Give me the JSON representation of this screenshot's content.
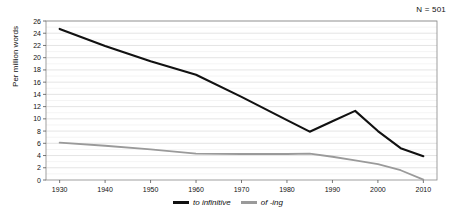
{
  "annotation": {
    "n_label": "N = 501"
  },
  "axes": {
    "ylabel": "Per million words",
    "xlabel": "",
    "yticks": [
      0,
      2,
      4,
      6,
      8,
      10,
      12,
      14,
      16,
      18,
      20,
      22,
      24,
      26
    ],
    "xticks": [
      1930,
      1940,
      1950,
      1960,
      1970,
      1980,
      1990,
      2000,
      2010
    ]
  },
  "legend": {
    "position": "bottom-center",
    "entries": [
      {
        "label": "to infinitive",
        "color": "#111111"
      },
      {
        "label": "of -ing",
        "color": "#9a9a9a"
      }
    ]
  },
  "colors": {
    "to_infinitive": "#111111",
    "of_ing": "#9a9a9a",
    "grid": "#d8d8d8",
    "frame": "#888888",
    "background": "#ffffff"
  },
  "chart_data": {
    "type": "line",
    "title": "",
    "xlabel": "",
    "ylabel": "Per million words",
    "xlim": [
      1927,
      2013
    ],
    "ylim": [
      0,
      26
    ],
    "grid": true,
    "legend_position": "bottom-center",
    "annotations": [
      "N = 501"
    ],
    "x": [
      1930,
      1940,
      1950,
      1960,
      1970,
      1980,
      1985,
      1990,
      1995,
      2000,
      2005,
      2010
    ],
    "series": [
      {
        "name": "to infinitive",
        "color": "#111111",
        "values": [
          24.7,
          21.9,
          19.4,
          17.2,
          13.6,
          9.8,
          7.9,
          9.6,
          11.3,
          8.0,
          5.2,
          3.9
        ]
      },
      {
        "name": "of -ing",
        "color": "#9a9a9a",
        "values": [
          6.1,
          5.6,
          5.0,
          4.3,
          4.25,
          4.25,
          4.3,
          3.8,
          3.2,
          2.6,
          1.6,
          0.05
        ]
      }
    ]
  }
}
